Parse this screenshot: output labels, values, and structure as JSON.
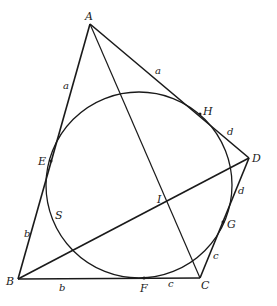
{
  "diagram": {
    "type": "geometry",
    "points": {
      "A": {
        "label": "A",
        "x": 90,
        "y": 24
      },
      "B": {
        "label": "B",
        "x": 18,
        "y": 279
      },
      "C": {
        "label": "C",
        "x": 200,
        "y": 278
      },
      "D": {
        "label": "D",
        "x": 249,
        "y": 158
      },
      "E": {
        "label": "E",
        "x": 51,
        "y": 161
      },
      "H": {
        "label": "H",
        "x": 200,
        "y": 114
      },
      "G": {
        "label": "G",
        "x": 223,
        "y": 222
      },
      "F": {
        "label": "F",
        "x": 144,
        "y": 278
      },
      "I": {
        "label": "I",
        "x": 166,
        "y": 203
      },
      "S": {
        "label": "S"
      }
    },
    "circle": {
      "cx": 139,
      "cy": 185,
      "r": 93
    },
    "segment_labels": {
      "AE": "a",
      "AH": "a",
      "HD": "d",
      "DG": "d",
      "GC": "c",
      "FC": "c",
      "BF": "b",
      "BE": "b"
    },
    "stroke_color": "#1a1a1a",
    "background": "#ffffff"
  }
}
